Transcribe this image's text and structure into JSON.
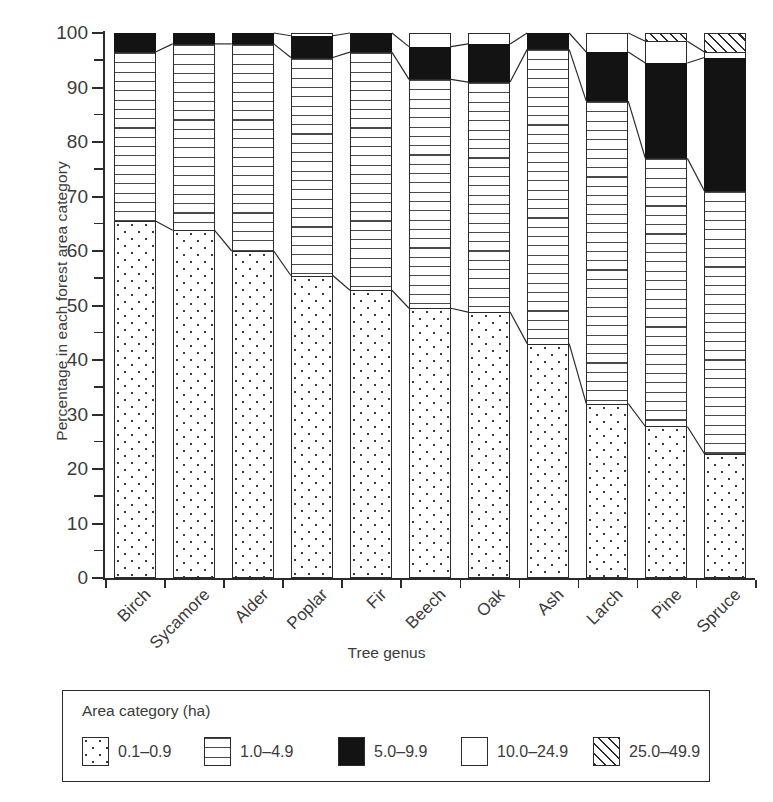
{
  "chart_data": {
    "type": "bar",
    "subtype": "stacked-100-percent",
    "title": "",
    "xlabel": "Tree genus",
    "ylabel": "Percentage in each forest area category",
    "ylim": [
      0,
      100
    ],
    "ytick_labels": [
      "0",
      "10",
      "20",
      "30",
      "40",
      "50",
      "60",
      "70",
      "80",
      "90",
      "100"
    ],
    "ytick_values": [
      0,
      10,
      20,
      30,
      40,
      50,
      60,
      70,
      80,
      90,
      100
    ],
    "yminor_step": 5,
    "grid": false,
    "legend_position": "below-plot",
    "legend_title": "Area category (ha)",
    "categories": [
      "Birch",
      "Sycamore",
      "Alder",
      "Poplar",
      "Fir",
      "Beech",
      "Oak",
      "Ash",
      "Larch",
      "Pine",
      "Spruce"
    ],
    "series": [
      {
        "name": "0.1–0.9",
        "pattern": "dots",
        "values": [
          65.5,
          63.8,
          60.0,
          55.5,
          52.8,
          49.5,
          48.8,
          43.0,
          32.0,
          27.8,
          22.8
        ]
      },
      {
        "name": "1.0–4.9",
        "pattern": "horizontal-lines",
        "values": [
          31.0,
          34.2,
          38.0,
          40.0,
          43.7,
          42.0,
          42.2,
          54.0,
          55.5,
          49.2,
          48.2
        ]
      },
      {
        "name": "5.0–9.9",
        "pattern": "solid-black",
        "values": [
          3.5,
          2.0,
          2.0,
          4.0,
          3.5,
          6.0,
          7.0,
          3.0,
          9.0,
          17.5,
          24.5
        ]
      },
      {
        "name": "10.0–24.9",
        "pattern": "white",
        "values": [
          0.0,
          0.0,
          0.0,
          0.5,
          0.0,
          2.5,
          2.0,
          0.0,
          3.5,
          4.0,
          1.0
        ]
      },
      {
        "name": "25.0–49.9",
        "pattern": "diagonal-hatch",
        "values": [
          0.0,
          0.0,
          0.0,
          0.0,
          0.0,
          0.0,
          0.0,
          0.0,
          0.0,
          1.5,
          3.5
        ]
      }
    ],
    "cumulative_tops": {
      "Birch": [
        65.5,
        96.5,
        100.0,
        100.0,
        100.0
      ],
      "Sycamore": [
        63.8,
        98.0,
        100.0,
        100.0,
        100.0
      ],
      "Alder": [
        60.0,
        98.0,
        100.0,
        100.0,
        100.0
      ],
      "Poplar": [
        55.5,
        95.5,
        99.5,
        100.0,
        100.0
      ],
      "Fir": [
        52.8,
        96.5,
        100.0,
        100.0,
        100.0
      ],
      "Beech": [
        49.5,
        91.5,
        97.5,
        100.0,
        100.0
      ],
      "Oak": [
        48.8,
        91.0,
        98.0,
        100.0,
        100.0
      ],
      "Ash": [
        43.0,
        97.0,
        100.0,
        100.0,
        100.0
      ],
      "Larch": [
        32.0,
        87.5,
        96.5,
        100.0,
        100.0
      ],
      "Pine": [
        27.8,
        77.0,
        94.5,
        98.5,
        100.0
      ],
      "Spruce": [
        22.8,
        71.0,
        95.5,
        96.5,
        100.0
      ]
    }
  },
  "legend": {
    "title": "Area category (ha)",
    "items": [
      {
        "label": "0.1–0.9",
        "pattern": "dots"
      },
      {
        "label": "1.0–4.9",
        "pattern": "horizontal-lines"
      },
      {
        "label": "5.0–9.9",
        "pattern": "solid-black"
      },
      {
        "label": "10.0–24.9",
        "pattern": "white"
      },
      {
        "label": "25.0–49.9",
        "pattern": "diagonal-hatch"
      }
    ]
  },
  "colors": {
    "ink": "#2b2b2b",
    "text": "#3b3b3b",
    "black_fill": "#131313",
    "background": "#ffffff"
  }
}
